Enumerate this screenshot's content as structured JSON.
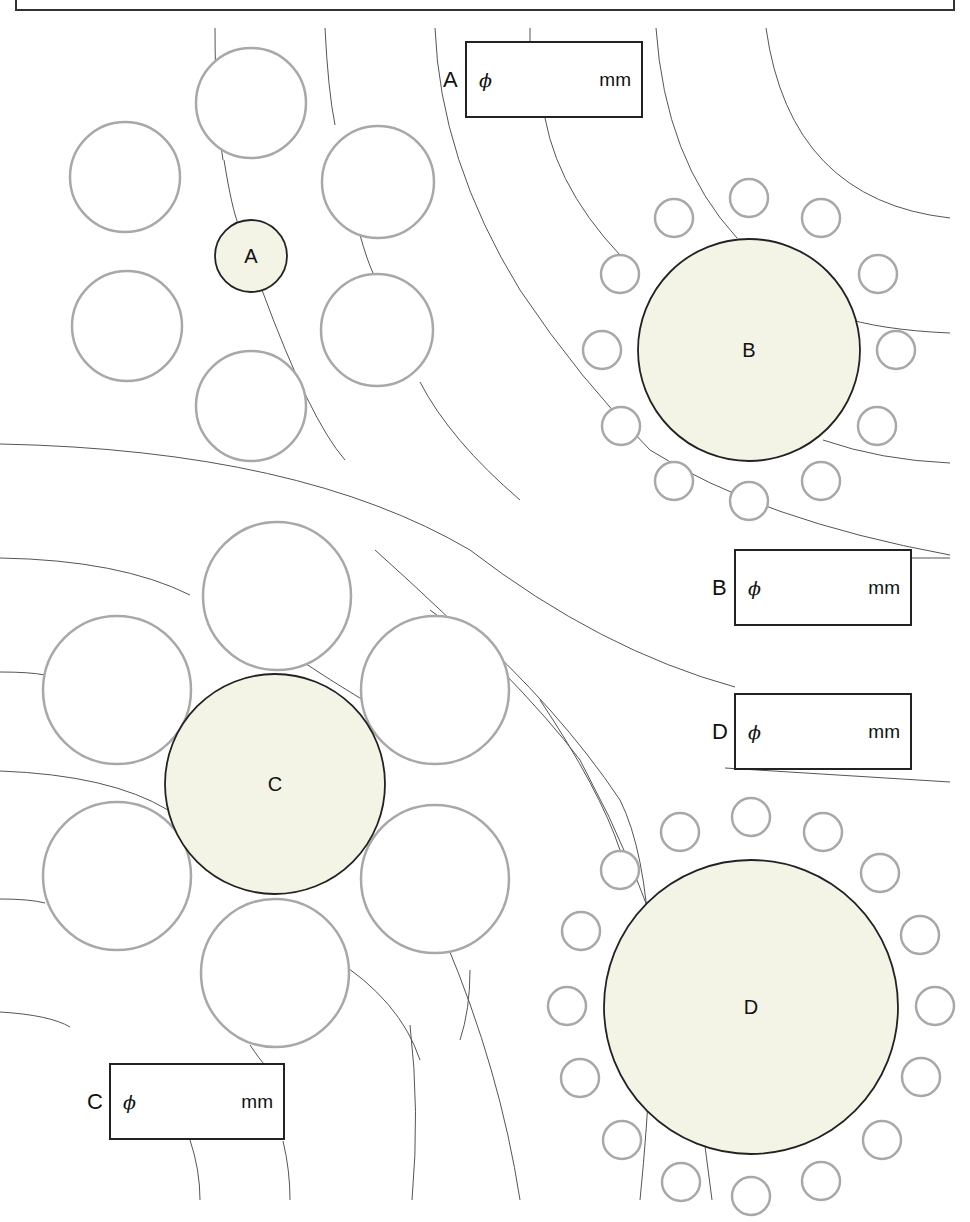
{
  "diagram": {
    "title": "",
    "colors": {
      "arc": "#555555",
      "small_circle_stroke": "#a8a8a8",
      "center_fill": "#f4f4e6",
      "center_stroke": "#222222",
      "box_stroke": "#222222"
    },
    "top_frame": {
      "x": 16,
      "y": -2,
      "w": 938,
      "h": 12
    },
    "groups": [
      {
        "id": "A",
        "label": "A",
        "center": {
          "cx": 251,
          "cy": 256,
          "r": 36
        },
        "surrounding": [
          {
            "cx": 251,
            "cy": 103,
            "r": 55
          },
          {
            "cx": 125,
            "cy": 177,
            "r": 55
          },
          {
            "cx": 378,
            "cy": 182,
            "r": 56
          },
          {
            "cx": 127,
            "cy": 326,
            "r": 55
          },
          {
            "cx": 377,
            "cy": 330,
            "r": 56
          },
          {
            "cx": 251,
            "cy": 406,
            "r": 55
          }
        ]
      },
      {
        "id": "B",
        "label": "B",
        "center": {
          "cx": 749,
          "cy": 350,
          "r": 111
        },
        "surrounding": [
          {
            "cx": 749,
            "cy": 198,
            "r": 19
          },
          {
            "cx": 674,
            "cy": 218,
            "r": 19
          },
          {
            "cx": 821,
            "cy": 218,
            "r": 19
          },
          {
            "cx": 620,
            "cy": 274,
            "r": 19
          },
          {
            "cx": 878,
            "cy": 274,
            "r": 19
          },
          {
            "cx": 602,
            "cy": 350,
            "r": 19
          },
          {
            "cx": 896,
            "cy": 350,
            "r": 19
          },
          {
            "cx": 621,
            "cy": 426,
            "r": 19
          },
          {
            "cx": 877,
            "cy": 426,
            "r": 19
          },
          {
            "cx": 674,
            "cy": 481,
            "r": 19
          },
          {
            "cx": 821,
            "cy": 481,
            "r": 19
          },
          {
            "cx": 749,
            "cy": 501,
            "r": 19
          }
        ]
      },
      {
        "id": "C",
        "label": "C",
        "center": {
          "cx": 275,
          "cy": 784,
          "r": 110
        },
        "surrounding": [
          {
            "cx": 277,
            "cy": 596,
            "r": 74
          },
          {
            "cx": 117,
            "cy": 690,
            "r": 74
          },
          {
            "cx": 435,
            "cy": 690,
            "r": 74
          },
          {
            "cx": 117,
            "cy": 876,
            "r": 74
          },
          {
            "cx": 435,
            "cy": 879,
            "r": 74
          },
          {
            "cx": 275,
            "cy": 973,
            "r": 74
          }
        ]
      },
      {
        "id": "D",
        "label": "D",
        "center": {
          "cx": 751,
          "cy": 1007,
          "r": 147
        },
        "surrounding": [
          {
            "cx": 751,
            "cy": 817,
            "r": 19
          },
          {
            "cx": 680,
            "cy": 832,
            "r": 19
          },
          {
            "cx": 823,
            "cy": 832,
            "r": 19
          },
          {
            "cx": 620,
            "cy": 870,
            "r": 19
          },
          {
            "cx": 880,
            "cy": 873,
            "r": 19
          },
          {
            "cx": 581,
            "cy": 931,
            "r": 19
          },
          {
            "cx": 920,
            "cy": 935,
            "r": 19
          },
          {
            "cx": 567,
            "cy": 1006,
            "r": 19
          },
          {
            "cx": 935,
            "cy": 1006,
            "r": 19
          },
          {
            "cx": 580,
            "cy": 1078,
            "r": 19
          },
          {
            "cx": 921,
            "cy": 1077,
            "r": 19
          },
          {
            "cx": 622,
            "cy": 1140,
            "r": 19
          },
          {
            "cx": 882,
            "cy": 1140,
            "r": 19
          },
          {
            "cx": 681,
            "cy": 1182,
            "r": 19
          },
          {
            "cx": 821,
            "cy": 1181,
            "r": 19
          },
          {
            "cx": 751,
            "cy": 1196,
            "r": 19
          }
        ]
      }
    ],
    "arcs": [
      "M 215 28 Q 215 110 223 160 M 224 160 Q 232 210 239 226 M 262 290 Q 310 420 345 460",
      "M 325 28 Q 328 90 335 125 M 360 235 Q 367 260 373 273 M 420 382 Q 450 440 520 500",
      "M 435 28 Q 440 160 520 290 Q 580 380 650 450 Q 760 520 950 555",
      "M 530 28 L 530 42",
      "M 545 118 Q 560 200 640 275",
      "M 656 28 Q 665 160 737 238",
      "M 766 28 Q 790 200 950 218",
      "M 838 316 Q 880 330 950 333",
      "M 823 440 Q 880 460 950 463",
      "M 911 558 L 950 558",
      "M 0 444 Q 300 450 470 550 Q 600 650 735 687",
      "M 0 558 Q 120 560 190 595",
      "M 0 672 Q 30 672 45 675",
      "M 0 771 Q 110 775 168 810",
      "M 0 899 Q 30 899 45 903",
      "M 0 1012 Q 50 1015 70 1027",
      "M 300 660 Q 330 680 363 700",
      "M 460 1040 Q 470 1010 470 970",
      "M 375 550 Q 520 680 580 760 Q 640 870 680 1000 Q 700 1100 712 1200",
      "M 460 620 Q 560 710 620 800 Q 670 900 640 1200",
      "M 725 768 L 950 782",
      "M 333 958 Q 400 1000 420 1060",
      "M 445 940 Q 500 1070 520 1200",
      "M 190 1140 Q 200 1170 200 1200",
      "M 283 1141 Q 290 1170 290 1200",
      "M 410 1025 Q 420 1110 412 1200",
      "M 250 1045 Q 260 1060 265 1065",
      "M 430 610 Q 470 640 490 650",
      "M 540 700 Q 600 790 620 850"
    ],
    "answer_boxes": [
      {
        "id": "A",
        "label": "A",
        "phi": "ϕ",
        "unit": "mm",
        "value": "",
        "x": 465,
        "y": 41,
        "w": 178,
        "h": 77
      },
      {
        "id": "B",
        "label": "B",
        "phi": "ϕ",
        "unit": "mm",
        "value": "",
        "x": 734,
        "y": 549,
        "w": 178,
        "h": 77
      },
      {
        "id": "D",
        "label": "D",
        "phi": "ϕ",
        "unit": "mm",
        "value": "",
        "x": 734,
        "y": 693,
        "w": 178,
        "h": 77
      },
      {
        "id": "C",
        "label": "C",
        "phi": "ϕ",
        "unit": "mm",
        "value": "",
        "x": 109,
        "y": 1063,
        "w": 176,
        "h": 77
      }
    ]
  }
}
